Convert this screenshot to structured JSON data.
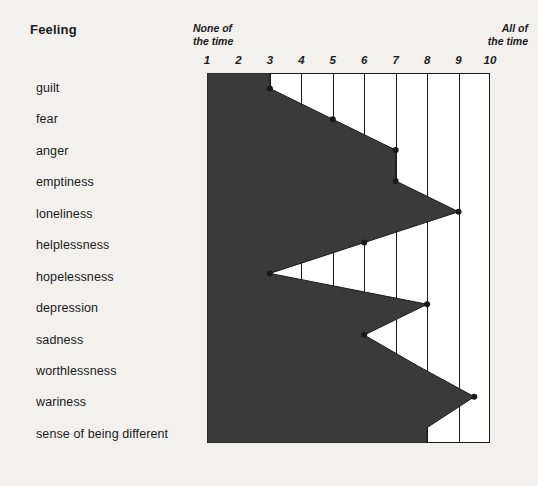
{
  "header": {
    "title": "Feeling"
  },
  "axis": {
    "left_caption": "None of\nthe time",
    "right_caption": "All of\nthe time",
    "ticks": [
      "1",
      "2",
      "3",
      "4",
      "5",
      "6",
      "7",
      "8",
      "9",
      "10"
    ]
  },
  "colors": {
    "fill": "#3a3a3a",
    "line": "#1a1a1a",
    "plot_background": "#ffffff",
    "page_background": "#f2f1ee"
  },
  "chart_data": {
    "type": "area",
    "orientation": "horizontal",
    "title": "Feeling",
    "xlabel": "",
    "ylabel": "Feeling",
    "xlim": [
      1,
      10
    ],
    "grid": true,
    "legend": false,
    "axis_low_label": "None of the time",
    "axis_high_label": "All of the time",
    "categories": [
      "guilt",
      "fear",
      "anger",
      "emptiness",
      "loneliness",
      "helplessness",
      "hopelessness",
      "depression",
      "sadness",
      "worthlessness",
      "wariness",
      "sense of being different"
    ],
    "values": [
      3,
      5,
      7,
      7,
      9,
      6,
      3,
      8,
      6,
      7.7,
      9.5,
      8
    ],
    "markers": [
      true,
      true,
      true,
      true,
      true,
      true,
      true,
      true,
      true,
      false,
      true,
      false
    ]
  }
}
